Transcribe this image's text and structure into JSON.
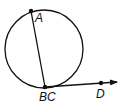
{
  "diagram": {
    "type": "geometry",
    "colors": {
      "stroke": "#111111",
      "background": "#ffffff"
    },
    "circle": {
      "cx": 44,
      "cy": 49,
      "r": 39
    },
    "points": [
      {
        "id": "A",
        "label": "A",
        "x": 31,
        "y": 11,
        "label_x": 35,
        "label_y": 22
      },
      {
        "id": "BC",
        "label": "BC",
        "x": 45,
        "y": 87,
        "label_x": 39,
        "label_y": 101
      },
      {
        "id": "D",
        "label": "D",
        "x": 101,
        "y": 83,
        "label_x": 96,
        "label_y": 98
      }
    ],
    "segments": [
      {
        "from": "A",
        "to": "BC",
        "kind": "chord"
      }
    ],
    "rays": [
      {
        "from": "BC",
        "through": "D",
        "end_x": 118,
        "end_y": 82
      }
    ]
  }
}
